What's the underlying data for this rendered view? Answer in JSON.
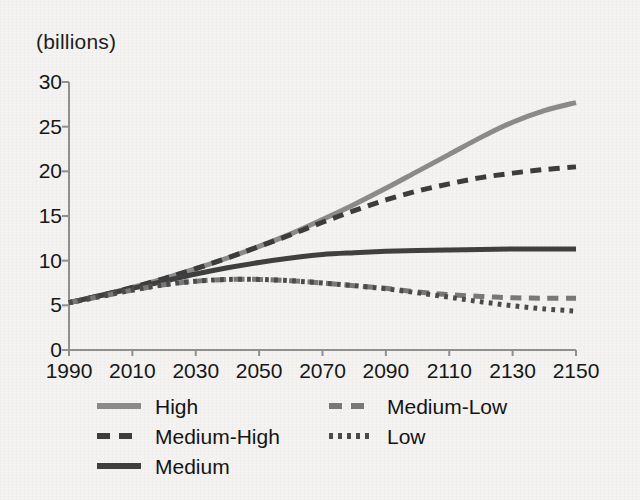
{
  "chart_data": {
    "type": "line",
    "title": "",
    "subtitle": "",
    "xlabel": "",
    "ylabel": "(billions)",
    "unit_note": "(billions)",
    "grid": false,
    "legend_position": "bottom",
    "xlim": [
      1990,
      2150
    ],
    "ylim": [
      0,
      30
    ],
    "xticks": [
      1990,
      2010,
      2030,
      2050,
      2070,
      2090,
      2110,
      2130,
      2150
    ],
    "yticks": [
      0,
      5,
      10,
      15,
      20,
      25,
      30
    ],
    "xtick_labels": [
      "1990",
      "2010",
      "2030",
      "2050",
      "2070",
      "2090",
      "2110",
      "2130",
      "2150"
    ],
    "ytick_labels": [
      "0",
      "5",
      "10",
      "15",
      "20",
      "25",
      "30"
    ],
    "x": [
      1990,
      2000,
      2010,
      2020,
      2030,
      2040,
      2050,
      2060,
      2070,
      2080,
      2090,
      2100,
      2110,
      2120,
      2130,
      2140,
      2150
    ],
    "series": [
      {
        "name": "High",
        "style": "solid",
        "color": "#8a8a8a",
        "width": 5,
        "values": [
          5.3,
          6.1,
          7.0,
          8.0,
          9.1,
          10.3,
          11.6,
          13.0,
          14.6,
          16.3,
          18.1,
          20.0,
          21.9,
          23.8,
          25.5,
          26.8,
          27.7
        ]
      },
      {
        "name": "Medium-High",
        "style": "dashed",
        "color": "#3c3c3c",
        "width": 5,
        "values": [
          5.3,
          6.1,
          7.0,
          8.0,
          9.1,
          10.3,
          11.6,
          12.9,
          14.3,
          15.6,
          16.8,
          17.8,
          18.6,
          19.3,
          19.8,
          20.2,
          20.5
        ]
      },
      {
        "name": "Medium",
        "style": "solid",
        "color": "#3f3f3f",
        "width": 5,
        "values": [
          5.3,
          6.1,
          6.9,
          7.7,
          8.5,
          9.2,
          9.8,
          10.3,
          10.7,
          10.9,
          11.05,
          11.15,
          11.2,
          11.25,
          11.3,
          11.3,
          11.3
        ]
      },
      {
        "name": "Medium-Low",
        "style": "dashed",
        "color": "#787878",
        "width": 5,
        "values": [
          5.3,
          6.0,
          6.7,
          7.3,
          7.7,
          7.9,
          7.9,
          7.75,
          7.5,
          7.2,
          6.9,
          6.5,
          6.2,
          6.0,
          5.85,
          5.8,
          5.8
        ]
      },
      {
        "name": "Low",
        "style": "dotted",
        "color": "#4a4a4a",
        "width": 5,
        "values": [
          5.3,
          6.0,
          6.7,
          7.3,
          7.7,
          7.9,
          7.9,
          7.75,
          7.5,
          7.2,
          6.85,
          6.4,
          5.9,
          5.4,
          4.95,
          4.6,
          4.35
        ]
      }
    ]
  },
  "legend": {
    "entries": [
      {
        "label": "High",
        "swatch": "solid-light-gray"
      },
      {
        "label": "Medium-High",
        "swatch": "dashed-dark"
      },
      {
        "label": "Medium",
        "swatch": "solid-dark"
      },
      {
        "label": "Medium-Low",
        "swatch": "dashed-gray"
      },
      {
        "label": "Low",
        "swatch": "dotted-dark"
      }
    ]
  },
  "colors": {
    "background": "#f4f3f1",
    "axis": "#8f8f8f",
    "text": "#161616",
    "high": "#8a8a8a",
    "medium_high": "#3c3c3c",
    "medium": "#3f3f3f",
    "medium_low": "#787878",
    "low": "#4a4a4a"
  }
}
